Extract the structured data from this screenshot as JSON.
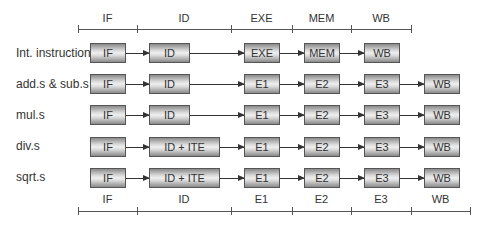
{
  "top_timeline": {
    "stages": [
      {
        "label": "IF",
        "x1": 78,
        "x2": 137
      },
      {
        "label": "ID",
        "x1": 137,
        "x2": 231
      },
      {
        "label": "EXE",
        "x1": 231,
        "x2": 292
      },
      {
        "label": "MEM",
        "x1": 292,
        "x2": 351
      },
      {
        "label": "WB",
        "x1": 351,
        "x2": 411
      }
    ]
  },
  "bottom_timeline": {
    "stages": [
      {
        "label": "IF",
        "x1": 78,
        "x2": 137
      },
      {
        "label": "ID",
        "x1": 137,
        "x2": 231
      },
      {
        "label": "E1",
        "x1": 231,
        "x2": 292
      },
      {
        "label": "E2",
        "x1": 292,
        "x2": 351
      },
      {
        "label": "E3",
        "x1": 351,
        "x2": 411
      },
      {
        "label": "WB",
        "x1": 411,
        "x2": 470
      }
    ]
  },
  "rows": [
    {
      "label": "Int. instructions",
      "stages": [
        "IF",
        "ID",
        "EXE",
        "MEM",
        "WB"
      ]
    },
    {
      "label": "add.s & sub.s",
      "stages": [
        "IF",
        "ID",
        "E1",
        "E2",
        "E3",
        "WB"
      ]
    },
    {
      "label": "mul.s",
      "stages": [
        "IF",
        "ID",
        "E1",
        "E2",
        "E3",
        "WB"
      ]
    },
    {
      "label": "div.s",
      "stages": [
        "IF",
        "ID + ITE",
        "E1",
        "E2",
        "E3",
        "WB"
      ]
    },
    {
      "label": "sqrt.s",
      "stages": [
        "IF",
        "ID + ITE",
        "E1",
        "E2",
        "E3",
        "WB"
      ]
    }
  ]
}
